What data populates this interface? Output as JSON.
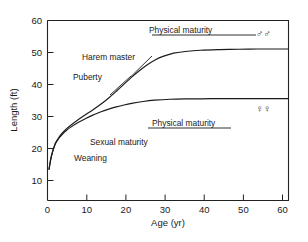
{
  "chart_data": {
    "type": "line",
    "title": "",
    "xlabel": "Age (yr)",
    "ylabel": "Length (ft)",
    "xlim": [
      0,
      63
    ],
    "ylim": [
      0,
      60
    ],
    "grid": false,
    "legend_position": "inline-annotations",
    "x_ticks": [
      {
        "value": 0,
        "label": "0"
      },
      {
        "value": 10,
        "label": "10"
      },
      {
        "value": 20,
        "label": "20"
      },
      {
        "value": 30,
        "label": "30"
      },
      {
        "value": 40,
        "label": "40"
      },
      {
        "value": 50,
        "label": "50"
      },
      {
        "value": 60,
        "label": "60"
      }
    ],
    "y_ticks": [
      {
        "value": 10,
        "label": "10"
      },
      {
        "value": 20,
        "label": "20"
      },
      {
        "value": 30,
        "label": "30"
      },
      {
        "value": 40,
        "label": "40"
      },
      {
        "value": 50,
        "label": "50"
      },
      {
        "value": 60,
        "label": "60"
      }
    ],
    "series": [
      {
        "name": "males",
        "symbol": "♂♂",
        "plateau_value": 51,
        "x": [
          0.4,
          1,
          2,
          3,
          4,
          5,
          6,
          8,
          10,
          12,
          14,
          16,
          18,
          20,
          22,
          24,
          26,
          28,
          30,
          33,
          36,
          40,
          45,
          50,
          55,
          60,
          63
        ],
        "y": [
          13.5,
          17.5,
          21.5,
          23.5,
          25.0,
          26.2,
          27.2,
          29.0,
          30.6,
          32.2,
          33.9,
          35.8,
          37.9,
          40.1,
          42.3,
          44.3,
          46.1,
          47.6,
          48.7,
          49.8,
          50.3,
          50.7,
          50.9,
          51.0,
          51.1,
          51.1,
          51.1
        ]
      },
      {
        "name": "females",
        "symbol": "♀♀",
        "plateau_value": 35.5,
        "x": [
          0.4,
          1,
          2,
          3,
          4,
          5,
          6,
          8,
          10,
          12,
          14,
          16,
          18,
          20,
          22,
          25,
          28,
          32,
          36,
          40,
          45,
          50,
          55,
          60,
          63
        ],
        "y": [
          13.5,
          17.5,
          21.3,
          23.2,
          24.6,
          25.7,
          26.6,
          28.1,
          29.4,
          30.5,
          31.5,
          32.3,
          33.0,
          33.6,
          34.1,
          34.7,
          35.1,
          35.4,
          35.5,
          35.5,
          35.6,
          35.6,
          35.6,
          35.6,
          35.6
        ]
      }
    ],
    "annotations": [
      {
        "id": "physical-maturity-male",
        "text": "Physical maturity",
        "x": 30,
        "y": 55
      },
      {
        "id": "harem-master",
        "text": "Harem master",
        "x": 13,
        "y": 45
      },
      {
        "id": "puberty",
        "text": "Puberty",
        "x": 10,
        "y": 39
      },
      {
        "id": "physical-maturity-female",
        "text": "Physical maturity",
        "x": 32,
        "y": 38
      },
      {
        "id": "sexual-maturity",
        "text": "Sexual maturity",
        "x": 15,
        "y": 26
      },
      {
        "id": "weaning",
        "text": "Weaning",
        "x": 9,
        "y": 21
      },
      {
        "id": "male-symbol",
        "text": "♂♂",
        "x": 52,
        "y": 55
      },
      {
        "id": "female-symbol",
        "text": "♀♀",
        "x": 52,
        "y": 38
      }
    ]
  },
  "axes": {
    "x_title": "Age (yr)",
    "y_title": "Length (ft)"
  },
  "labels": {
    "physical_maturity_male": "Physical maturity",
    "physical_maturity_female": "Physical maturity",
    "harem_master": "Harem master",
    "puberty": "Puberty",
    "sexual_maturity": "Sexual maturity",
    "weaning": "Weaning",
    "male_symbol": "♂♂",
    "female_symbol": "♀♀"
  },
  "ticks": {
    "x": [
      "0",
      "10",
      "20",
      "30",
      "40",
      "50",
      "60"
    ],
    "y": [
      "10",
      "20",
      "30",
      "40",
      "50",
      "60"
    ]
  },
  "colors": {
    "ink": "#1a1a1a",
    "background": "#ffffff"
  }
}
